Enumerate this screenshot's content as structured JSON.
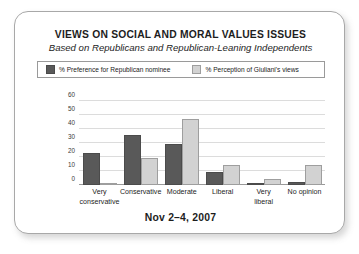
{
  "header": {
    "title": "VIEWS ON SOCIAL AND MORAL VALUES ISSUES",
    "subtitle": "Based on Republicans and Republican-Leaning Independents"
  },
  "legend": {
    "series": [
      {
        "label": "% Preference for Republican nominee",
        "swatch_icon": "dark-square-icon",
        "color": "#595959"
      },
      {
        "label": "% Perception of Giuliani's views",
        "swatch_icon": "light-square-icon",
        "color": "#d2d2d2"
      }
    ]
  },
  "footer": {
    "date": "Nov 2–4, 2007"
  },
  "colors": {
    "series_dark": "#595959",
    "series_light": "#d2d2d2",
    "gridline": "#dcdcdc",
    "axis": "#9a9a9a",
    "card_border": "#a8a8a8",
    "text": "#1d1d1d",
    "background": "#ffffff"
  },
  "chart_data": {
    "type": "bar",
    "title": "VIEWS ON SOCIAL AND MORAL VALUES ISSUES",
    "subtitle": "Based on Republicans and Republican-Leaning Independents",
    "xlabel": "",
    "ylabel": "",
    "ylim": [
      0,
      60
    ],
    "yticks": [
      0,
      10,
      20,
      30,
      40,
      50,
      60
    ],
    "ytick_labels": [
      "0",
      "10",
      "20",
      "30",
      "40",
      "50",
      "60"
    ],
    "grid": true,
    "legend_position": "top",
    "categories": [
      "Very conservative",
      "Conservative",
      "Moderate",
      "Liberal",
      "Very liberal",
      "No opinion"
    ],
    "category_lines": [
      [
        "Very",
        "conservative"
      ],
      [
        "Conservative"
      ],
      [
        "Moderate"
      ],
      [
        "Liberal"
      ],
      [
        "Very",
        "liberal"
      ],
      [
        "No opinion"
      ]
    ],
    "series": [
      {
        "name": "% Preference for Republican nominee",
        "color": "#595959",
        "values": [
          23,
          36,
          29,
          9,
          1,
          2
        ]
      },
      {
        "name": "% Perception of Giuliani's views",
        "color": "#d2d2d2",
        "values": [
          1,
          19,
          47,
          14,
          4,
          14
        ]
      }
    ],
    "annotation": "Nov 2–4, 2007"
  }
}
